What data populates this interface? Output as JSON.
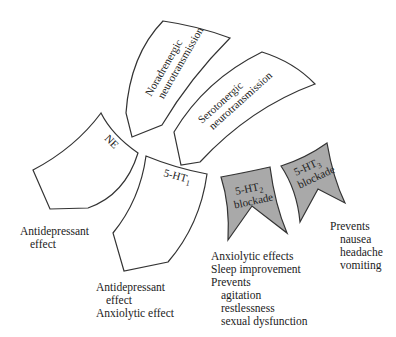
{
  "diagram": {
    "shapes": {
      "noradrenergic": {
        "line1": "Noradrenergic",
        "line2": "neurotransmission"
      },
      "serotonergic": {
        "line1": "Serotonergic",
        "line2": "neurotransmission"
      },
      "ne": {
        "label": "NE"
      },
      "ht1": {
        "label": "5-HT",
        "sub": "1"
      },
      "ht2": {
        "label": "5-HT",
        "sub": "2",
        "line2": "blockade"
      },
      "ht3": {
        "label": "5-HT",
        "sub": "3",
        "line2": "blockade"
      }
    },
    "effects": {
      "ne": [
        "Antidepressant",
        "effect"
      ],
      "ht1": [
        "Antidepressant",
        "effect",
        "Anxiolytic effect"
      ],
      "ht2": [
        "Anxiolytic effects",
        "Sleep improvement",
        "Prevents",
        "agitation",
        "restlessness",
        "sexual dysfunction"
      ],
      "ht3": [
        "Prevents",
        "nausea",
        "headache",
        "vomiting"
      ]
    },
    "colors": {
      "blockade_fill": "#a9a9a9",
      "outline": "#333333",
      "background": "#ffffff"
    }
  }
}
